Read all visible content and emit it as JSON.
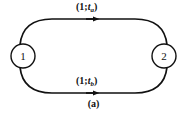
{
  "figure": {
    "caption": "(a)",
    "background_color": "#ffffff",
    "ink_color": "#111111"
  },
  "nodes": [
    {
      "id": "1",
      "label": "1",
      "cx": 23,
      "cy": 56,
      "r": 12
    },
    {
      "id": "2",
      "label": "2",
      "cx": 164,
      "cy": 56,
      "r": 12
    }
  ],
  "edges": [
    {
      "id": "edge-a",
      "from": "1",
      "to": "2",
      "direction": "right",
      "position": "top",
      "label": {
        "open": "(",
        "capacity": "1",
        "separator": ";",
        "variable": "t",
        "subscript": "a",
        "close": ")",
        "full": "(1;ta)"
      }
    },
    {
      "id": "edge-b",
      "from": "1",
      "to": "2",
      "direction": "right",
      "position": "bottom",
      "label": {
        "open": "(",
        "capacity": "1",
        "separator": ";",
        "variable": "t",
        "subscript": "b",
        "close": ")",
        "full": "(1;tb)"
      }
    }
  ]
}
